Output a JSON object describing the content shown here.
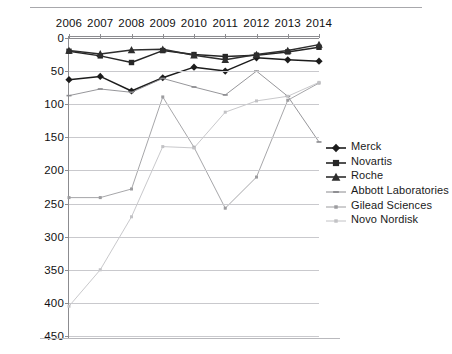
{
  "chart_data": {
    "type": "line",
    "title": "",
    "subtitle": "",
    "xlabel": "",
    "ylabel": "",
    "x": [
      2006,
      2007,
      2008,
      2009,
      2010,
      2011,
      2012,
      2013,
      2014
    ],
    "categories": [
      "2006",
      "2007",
      "2008",
      "2009",
      "2010",
      "2011",
      "2012",
      "2013",
      "2014"
    ],
    "ylim": [
      0,
      450
    ],
    "y_inverted": true,
    "y_ticks": [
      0,
      50,
      100,
      150,
      200,
      250,
      300,
      350,
      400,
      450
    ],
    "y_tick_labels": [
      "0",
      "50",
      "100",
      "150",
      "200",
      "250",
      "300",
      "350",
      "400",
      "450"
    ],
    "grid": "horizontal",
    "legend_position": "right",
    "series": [
      {
        "name": "Merck",
        "color": "#1c1c1c",
        "marker": "diamond",
        "values": [
          63,
          58,
          80,
          60,
          44,
          50,
          30,
          33,
          35
        ]
      },
      {
        "name": "Novartis",
        "color": "#262626",
        "marker": "square",
        "values": [
          20,
          27,
          37,
          19,
          25,
          28,
          26,
          21,
          14
        ]
      },
      {
        "name": "Roche",
        "color": "#2e2e2e",
        "marker": "triangle",
        "values": [
          19,
          24,
          18,
          17,
          26,
          33,
          25,
          19,
          10
        ]
      },
      {
        "name": "Abbott Laboratories",
        "color": "#8a8a8e",
        "marker": "dash",
        "values": [
          87,
          77,
          82,
          61,
          74,
          86,
          50,
          88,
          157
        ]
      },
      {
        "name": "Gilead Sciences",
        "color": "#9c9c9f",
        "marker": "dot",
        "values": [
          241,
          241,
          228,
          89,
          165,
          257,
          210,
          94,
          68
        ]
      },
      {
        "name": "Novo Nordisk",
        "color": "#c2c2c5",
        "marker": "dot",
        "values": [
          405,
          350,
          270,
          164,
          166,
          112,
          95,
          88,
          67
        ]
      }
    ]
  },
  "legend": {
    "items": [
      {
        "label": "Merck"
      },
      {
        "label": "Novartis"
      },
      {
        "label": "Roche"
      },
      {
        "label": "Abbott Laboratories"
      },
      {
        "label": "Gilead Sciences"
      },
      {
        "label": "Novo Nordisk"
      }
    ]
  }
}
